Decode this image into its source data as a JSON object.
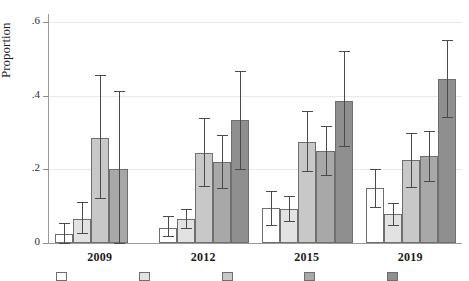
{
  "chart_data": {
    "type": "bar",
    "title": "",
    "subtitle": "",
    "xlabel": "",
    "ylabel": "Proportion",
    "ylim": [
      0,
      0.6
    ],
    "yticks": [
      0,
      0.2,
      0.4,
      0.6
    ],
    "ytick_labels": [
      "0",
      ".2",
      ".4",
      ".6"
    ],
    "grid": true,
    "grid_axis": "y",
    "legend_position": "bottom",
    "legend_visible": false,
    "legend_note": "legend row is cropped by the bottom edge of the image; only the top sliver of the colour swatches is visible and no legend label text is legible",
    "categories": [
      "2009",
      "2012",
      "2015",
      "2019"
    ],
    "error_bars": "95% confidence interval",
    "series": [
      {
        "name": "series-1",
        "color": "#ffffff",
        "values": [
          0.025,
          0.04,
          0.095,
          0.148
        ],
        "ci_low": [
          0.0,
          0.018,
          0.05,
          0.098
        ],
        "ci_high": [
          0.055,
          0.072,
          0.142,
          0.2
        ]
      },
      {
        "name": "series-2",
        "color": "#e2e2e2",
        "values": [
          0.065,
          0.065,
          0.093,
          0.078
        ],
        "ci_low": [
          0.028,
          0.04,
          0.06,
          0.05
        ],
        "ci_high": [
          0.112,
          0.092,
          0.128,
          0.108
        ]
      },
      {
        "name": "series-3",
        "color": "#c8c8c8",
        "values": [
          0.285,
          0.245,
          0.275,
          0.225
        ],
        "ci_low": [
          0.122,
          0.155,
          0.195,
          0.152
        ],
        "ci_high": [
          0.455,
          0.34,
          0.358,
          0.3
        ]
      },
      {
        "name": "series-4",
        "color": "#a8a8a8",
        "values": [
          0.2,
          0.22,
          0.25,
          0.237
        ],
        "ci_low": [
          0.0,
          0.148,
          0.185,
          0.168
        ],
        "ci_high": [
          0.412,
          0.292,
          0.318,
          0.305
        ]
      },
      {
        "name": "series-5",
        "color": "#8f8f8f",
        "values": [
          null,
          0.335,
          0.385,
          0.445
        ],
        "ci_low": [
          null,
          0.202,
          0.262,
          0.342
        ],
        "ci_high": [
          null,
          0.468,
          0.52,
          0.552
        ]
      }
    ]
  },
  "axis": {
    "y_title": "Proportion",
    "y_labels": [
      "0",
      ".2",
      ".4",
      ".6"
    ],
    "x_labels": [
      "2009",
      "2012",
      "2015",
      "2019"
    ]
  },
  "watermark": {
    "text": ""
  }
}
